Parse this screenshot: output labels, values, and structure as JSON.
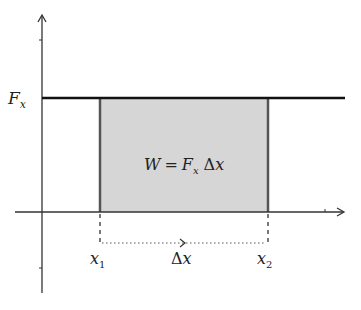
{
  "diagram": {
    "labels": {
      "force": "F",
      "force_sub": "x",
      "formula_w": "W",
      "formula_eq": "=",
      "formula_f": "F",
      "formula_f_sub": "x",
      "formula_delta": "Δ",
      "formula_x": "x",
      "x1": "x",
      "x1_sub": "1",
      "x2": "x",
      "x2_sub": "2",
      "delta": "Δ",
      "delta_x": "x"
    },
    "colors": {
      "axis": "#333333",
      "force_line": "#111111",
      "rect_fill": "#d6d6d6",
      "rect_edge": "#555555"
    }
  }
}
